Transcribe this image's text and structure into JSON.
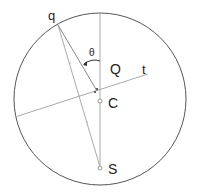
{
  "diagram": {
    "labels": {
      "q": "q",
      "theta": "θ",
      "Q": "Q",
      "t": "t",
      "C": "C",
      "S": "S"
    },
    "colors": {
      "circle": "#555555",
      "lines": "#aaaaaa",
      "text": "#222222"
    }
  }
}
